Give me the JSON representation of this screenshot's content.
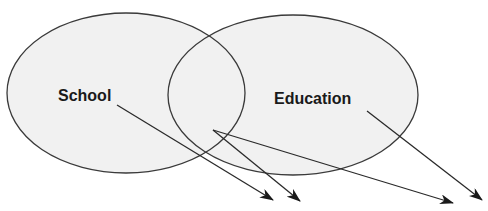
{
  "diagram": {
    "type": "venn",
    "colors": {
      "fill": "#f1f1f1",
      "stroke": "#3a3a3a",
      "text": "#1a1a1a",
      "arrow": "#2a2a2a"
    },
    "sets": [
      {
        "id": "school",
        "label": "School",
        "cx": 126,
        "cy": 93,
        "rx": 119,
        "ry": 80,
        "label_x": 58,
        "label_y": 101
      },
      {
        "id": "education",
        "label": "Education",
        "cx": 293,
        "cy": 95,
        "rx": 125,
        "ry": 80,
        "label_x": 274,
        "label_y": 104
      }
    ],
    "arrows": [
      {
        "from": "school",
        "x1": 117,
        "y1": 105,
        "x2": 273,
        "y2": 200
      },
      {
        "from": "intersection",
        "x1": 213,
        "y1": 130,
        "x2": 300,
        "y2": 201
      },
      {
        "from": "intersection",
        "x1": 213,
        "y1": 130,
        "x2": 453,
        "y2": 203
      },
      {
        "from": "education",
        "x1": 367,
        "y1": 111,
        "x2": 482,
        "y2": 200
      }
    ]
  }
}
